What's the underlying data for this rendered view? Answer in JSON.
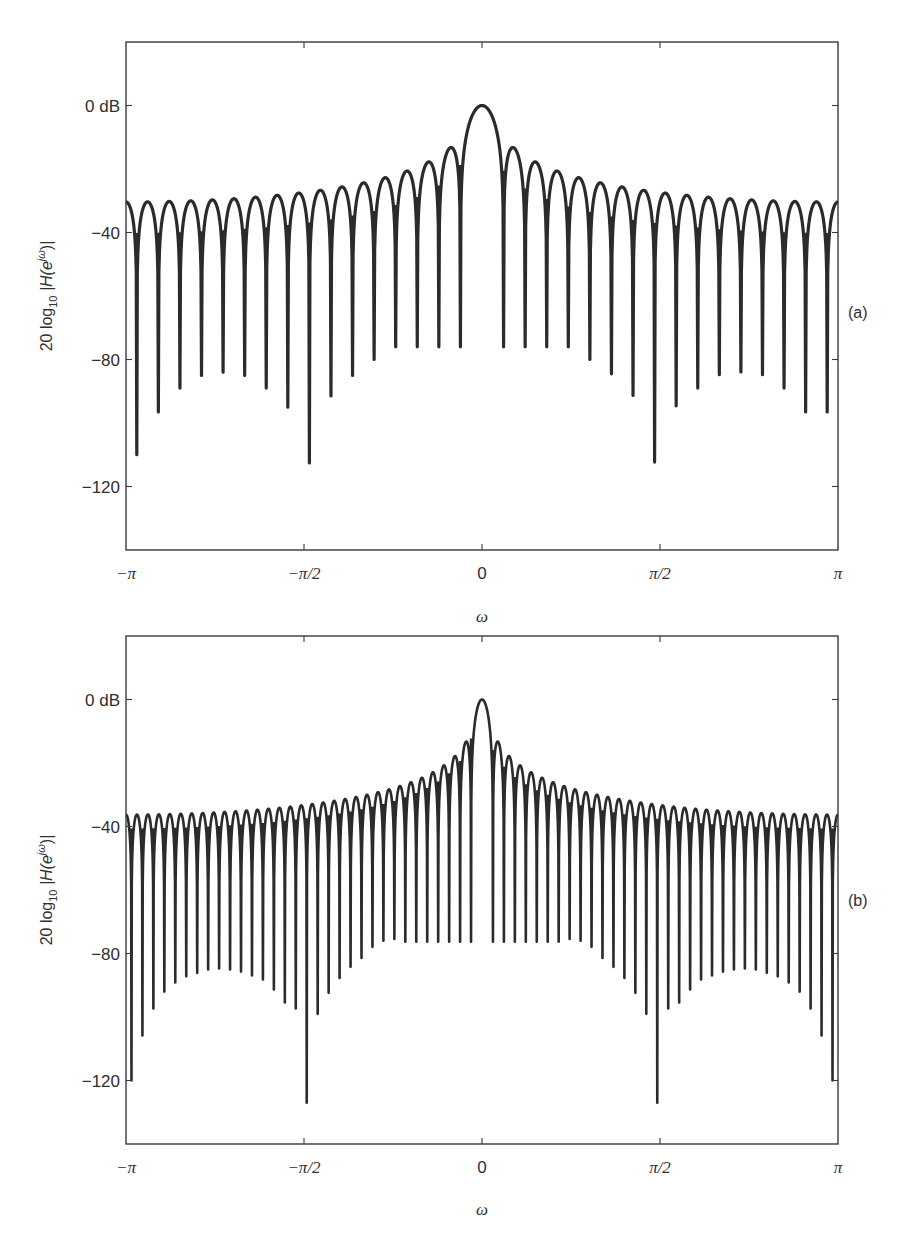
{
  "figure": {
    "background": "#ffffff",
    "line_color": "#2b2b2b",
    "axis_color": "#3a3a3a"
  },
  "chart_data": [
    {
      "id": "a",
      "type": "line",
      "panel_label": "(a)",
      "title": "",
      "xlabel": "ω",
      "ylabel": "20 log10 |H(e^{jω})|",
      "ylabel_parts": {
        "prefix": "20 log",
        "sub": "10",
        "mid": " |H(e",
        "sup": "jω",
        "suffix": ")|"
      },
      "xlim": [
        "-π",
        "π"
      ],
      "ylim": [
        -140,
        20
      ],
      "x_ticks": [
        {
          "value": -1.0,
          "label": "−π"
        },
        {
          "value": -0.5,
          "label": "−π/2"
        },
        {
          "value": 0.0,
          "label": "0"
        },
        {
          "value": 0.5,
          "label": "π/2"
        },
        {
          "value": 1.0,
          "label": "π"
        }
      ],
      "y_ticks": [
        {
          "value": 0,
          "label": "0 dB"
        },
        {
          "value": -40,
          "label": "−40"
        },
        {
          "value": -80,
          "label": "−80"
        },
        {
          "value": -120,
          "label": "−120"
        }
      ],
      "grid": false,
      "legend": null,
      "series": [
        {
          "name": "Rectangular window magnitude response",
          "window": "rectangular",
          "N": 33,
          "peak_db": 0,
          "first_sidelobe_db": -12.3,
          "edge_sidelobe_db": -30,
          "sidelobe_peaks_db_left_to_center": [
            -30,
            -29.7,
            -29,
            -29,
            -28.4,
            -27.8,
            -27.1,
            -26.2,
            -24.9,
            -24.8,
            -23,
            -22.4,
            -20.5,
            -17.4,
            -12.3
          ],
          "null_depths_db_left_to_right": [
            -110,
            -96.5,
            -89,
            -85,
            -84,
            -85,
            -89,
            -95,
            -112.6,
            -91.5,
            -85,
            -80,
            -76,
            -76,
            -76,
            -76,
            -76,
            -76,
            -76,
            -76,
            -80,
            -84.5,
            -91.3,
            -112.3,
            -94.6,
            -89,
            -84.8,
            -83.9,
            -84.8,
            -89,
            -96.5,
            -96.5
          ]
        }
      ]
    },
    {
      "id": "b",
      "type": "line",
      "panel_label": "(b)",
      "title": "",
      "xlabel": "ω",
      "ylabel": "20 log10 |H(e^{jω})|",
      "ylabel_parts": {
        "prefix": "20 log",
        "sub": "10",
        "mid": " |H(e",
        "sup": "jω",
        "suffix": ")|"
      },
      "xlim": [
        "-π",
        "π"
      ],
      "ylim": [
        -140,
        20
      ],
      "x_ticks": [
        {
          "value": -1.0,
          "label": "−π"
        },
        {
          "value": -0.5,
          "label": "−π/2"
        },
        {
          "value": 0.0,
          "label": "0"
        },
        {
          "value": 0.5,
          "label": "π/2"
        },
        {
          "value": 1.0,
          "label": "π"
        }
      ],
      "y_ticks": [
        {
          "value": 0,
          "label": "0 dB"
        },
        {
          "value": -40,
          "label": "−40"
        },
        {
          "value": -80,
          "label": "−80"
        },
        {
          "value": -120,
          "label": "−120"
        }
      ],
      "grid": false,
      "legend": null,
      "series": [
        {
          "name": "Rectangular window magnitude response",
          "window": "rectangular",
          "N": 65,
          "peak_db": 0,
          "first_sidelobe_db": -12,
          "edge_sidelobe_db": -36.5,
          "null_depths_db_left_half": [
            -120,
            -105.8,
            -97.3,
            -92,
            -89.1,
            -87.2,
            -86.1,
            -85,
            -84.7,
            -85,
            -85.7,
            -86.9,
            -88.2,
            -91.3,
            -95.4,
            -97.3,
            -127,
            -99,
            -92.4,
            -87.7,
            -84.2,
            -81.4,
            -77.9,
            -76,
            -75.4,
            -76.3,
            -76.3,
            -76.3,
            -76.3,
            -76.3,
            -76.3,
            -76.3
          ],
          "null_depths_db_right_half": [
            -76.3,
            -76.3,
            -76.3,
            -76.3,
            -76.3,
            -76.3,
            -76.3,
            -75.4,
            -76,
            -77.9,
            -81.4,
            -84.2,
            -87.7,
            -92.4,
            -99,
            -127,
            -97.3,
            -95.4,
            -91.3,
            -88.2,
            -86.9,
            -85.7,
            -85,
            -84.7,
            -85,
            -86.1,
            -87.2,
            -89.1,
            -92,
            -97.3,
            -105.8,
            -120
          ]
        }
      ]
    }
  ]
}
